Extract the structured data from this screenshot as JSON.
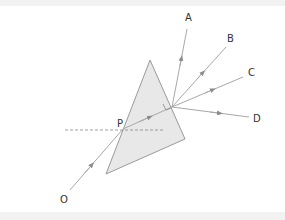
{
  "diagram": {
    "type": "ray-diagram-prism",
    "labels": {
      "A": "A",
      "B": "B",
      "C": "C",
      "D": "D",
      "O": "O",
      "P": "P"
    },
    "colors": {
      "prism_fill": "#e8e8e8",
      "prism_stroke": "#9a9a9a",
      "ray": "#a8a8a8",
      "arrow": "#8c8c8c",
      "normal_dashed": "#888888",
      "text": "#333333",
      "background": "#ffffff",
      "border": "#f2f2f2"
    },
    "prism": {
      "apex": [
        150,
        60
      ],
      "bottom_left": [
        106,
        174
      ],
      "bottom_right": [
        185,
        139
      ]
    },
    "incident_ray": {
      "from": "O",
      "to": "P"
    },
    "refracted_ray": {
      "from": "P",
      "to": "exit_point"
    },
    "emergent_rays": [
      "A",
      "B",
      "C",
      "D"
    ],
    "right_angle_marker": true,
    "normal_at_P": "dashed horizontal line"
  }
}
